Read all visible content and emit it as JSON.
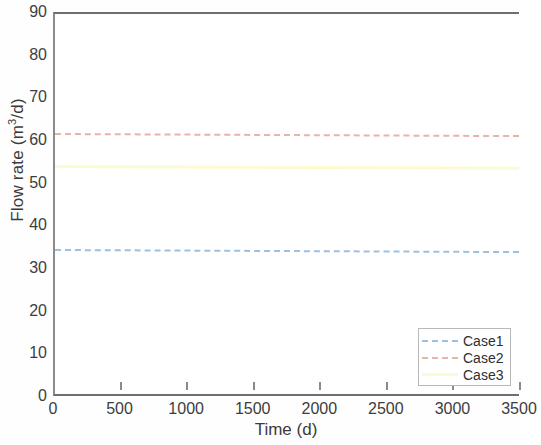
{
  "chart_data": {
    "type": "line",
    "title": "",
    "xlabel": "Time (d)",
    "ylabel": "Flow rate (m3/d)",
    "ylabel_parts": {
      "pre": "Flow rate (m",
      "sup": "3",
      "post": "/d)"
    },
    "xlim": [
      0,
      3500
    ],
    "ylim": [
      0,
      90
    ],
    "xticks": [
      0,
      500,
      1000,
      1500,
      2000,
      2500,
      3000,
      3500
    ],
    "xtick_labels": [
      "0",
      "500",
      "1000",
      "1500",
      "2000",
      "2500",
      "3000",
      "3500"
    ],
    "yticks": [
      0,
      10,
      20,
      30,
      40,
      50,
      60,
      70,
      80,
      90
    ],
    "ytick_labels": [
      "0",
      "10",
      "20",
      "30",
      "40",
      "50",
      "60",
      "70",
      "80",
      "90"
    ],
    "grid": false,
    "legend_position": "lower right",
    "series": [
      {
        "name": "Case1",
        "color": "#9dbfe0",
        "linestyle": "dashed",
        "x": [
          0,
          500,
          1000,
          1500,
          2000,
          2500,
          3000,
          3500
        ],
        "values": [
          35.0,
          34.9,
          34.8,
          34.8,
          34.7,
          34.6,
          34.6,
          34.5
        ],
        "level": 34.8
      },
      {
        "name": "Case2",
        "color": "#e8b4a3",
        "linestyle": "dashdot",
        "x": [
          0,
          500,
          1000,
          1500,
          2000,
          2500,
          3000,
          3500
        ],
        "values": [
          62.0,
          61.9,
          61.8,
          61.8,
          61.7,
          61.6,
          61.6,
          61.5
        ],
        "level": 61.8
      },
      {
        "name": "Case3",
        "color": "#fbfbd2",
        "linestyle": "solid",
        "x": [
          0,
          500,
          1000,
          1500,
          2000,
          2500,
          3000,
          3500
        ],
        "values": [
          54.6,
          54.5,
          54.5,
          54.4,
          54.4,
          54.3,
          54.3,
          54.2
        ],
        "level": 54.4
      }
    ]
  },
  "legend": {
    "entries": [
      {
        "label": "Case1"
      },
      {
        "label": "Case2"
      },
      {
        "label": "Case3"
      }
    ]
  }
}
